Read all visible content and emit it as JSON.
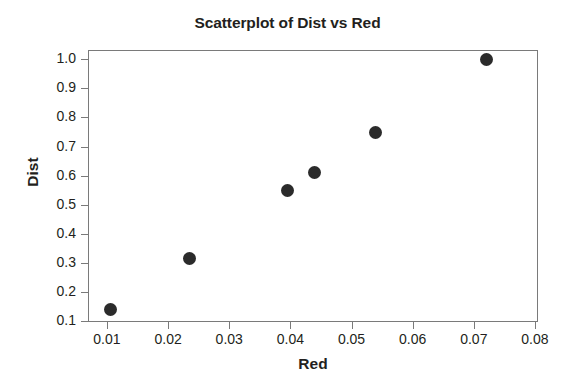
{
  "chart_data": {
    "type": "scatter",
    "title": "Scatterplot of Dist vs Red",
    "xlabel": "Red",
    "ylabel": "Dist",
    "xlim": [
      0.0069,
      0.0805
    ],
    "ylim": [
      0.097,
      1.032
    ],
    "grid": false,
    "legend": null,
    "xticks": [
      0.01,
      0.02,
      0.03,
      0.04,
      0.05,
      0.06,
      0.07,
      0.08
    ],
    "xtick_labels": [
      "0.01",
      "0.02",
      "0.03",
      "0.04",
      "0.05",
      "0.06",
      "0.07",
      "0.08"
    ],
    "yticks": [
      0.1,
      0.2,
      0.3,
      0.4,
      0.5,
      0.6,
      0.7,
      0.8,
      0.9,
      1.0
    ],
    "ytick_labels": [
      "0.1",
      "0.2",
      "0.3",
      "0.4",
      "0.5",
      "0.6",
      "0.7",
      "0.8",
      "0.9",
      "1.0"
    ],
    "marker": {
      "shape": "circle",
      "color": "#2b2b2b",
      "size_px": 13
    },
    "series": [
      {
        "name": "Dist vs Red",
        "points": [
          {
            "x": 0.0105,
            "y": 0.14
          },
          {
            "x": 0.0235,
            "y": 0.315
          },
          {
            "x": 0.0395,
            "y": 0.55
          },
          {
            "x": 0.044,
            "y": 0.61
          },
          {
            "x": 0.054,
            "y": 0.75
          },
          {
            "x": 0.072,
            "y": 1.0
          }
        ]
      }
    ]
  }
}
